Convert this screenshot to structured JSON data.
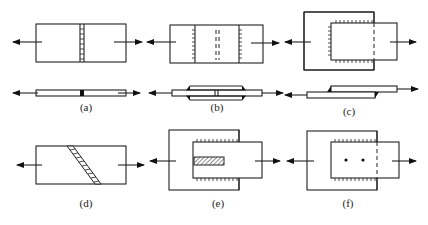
{
  "figure": {
    "panels": [
      {
        "id": "a",
        "label": "(a)",
        "type": "butt joint",
        "views": [
          "top",
          "side"
        ]
      },
      {
        "id": "b",
        "label": "(b)",
        "type": "butt joint with double cover plates",
        "views": [
          "top",
          "side"
        ]
      },
      {
        "id": "c",
        "label": "(c)",
        "type": "lap joint with fillet welds",
        "views": [
          "top",
          "side"
        ]
      },
      {
        "id": "d",
        "label": "(d)",
        "type": "oblique (scarf) butt joint",
        "views": [
          "top"
        ]
      },
      {
        "id": "e",
        "label": "(e)",
        "type": "lap joint with slot weld",
        "views": [
          "top"
        ]
      },
      {
        "id": "f",
        "label": "(f)",
        "type": "lap joint with spot/plug welds",
        "views": [
          "top"
        ]
      }
    ]
  },
  "icons": {
    "arrow": "arrow-icon",
    "weld_hatch": "weld-hatch-icon",
    "spot_weld": "spot-weld-icon"
  },
  "colors": {
    "line": "#222222",
    "background": "#ffffff"
  }
}
